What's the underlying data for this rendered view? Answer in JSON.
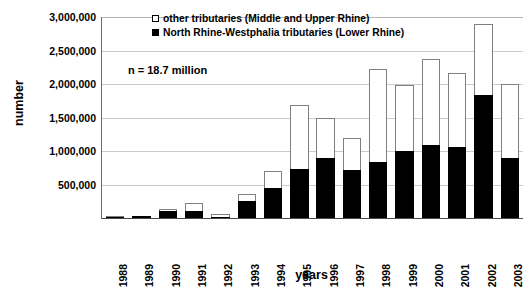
{
  "chart_data": {
    "type": "bar",
    "subtype": "stacked",
    "title": "",
    "xlabel": "years",
    "ylabel": "number",
    "ylim": [
      0,
      3000000
    ],
    "ytick_labels": [
      "3,000,000",
      "2,500,000",
      "2,000,000",
      "1,500,000",
      "1,000,000",
      "500,000"
    ],
    "ytick_values": [
      3000000,
      2500000,
      2000000,
      1500000,
      1000000,
      500000
    ],
    "grid": true,
    "legend_position": "top-center",
    "annotation": "n = 18.7 million",
    "categories": [
      "1988",
      "1989",
      "1990",
      "1991",
      "1992",
      "1993",
      "1994",
      "1995",
      "1996",
      "1997",
      "1998",
      "1999",
      "2000",
      "2001",
      "2002",
      "2003"
    ],
    "series": [
      {
        "name": "North Rhine-Westphalia tributaries (Lower Rhine)",
        "color": "#000000",
        "values": [
          4000,
          30000,
          110000,
          105000,
          10000,
          250000,
          450000,
          730000,
          900000,
          710000,
          840000,
          1000000,
          1090000,
          1060000,
          1830000,
          890000
        ]
      },
      {
        "name": "other tributaries (Middle and Upper Rhine)",
        "color": "#ffffff",
        "values": [
          1000,
          5000,
          25000,
          125000,
          50000,
          110000,
          250000,
          960000,
          590000,
          480000,
          1390000,
          990000,
          1290000,
          1100000,
          1070000,
          1110000
        ]
      }
    ],
    "totals": [
      5000,
      35000,
      135000,
      230000,
      60000,
      360000,
      700000,
      1690000,
      1490000,
      1190000,
      2230000,
      1990000,
      2380000,
      2160000,
      2900000,
      2000000
    ]
  },
  "legend": {
    "entries": [
      {
        "label": "other tributaries (Middle and Upper Rhine)",
        "swatch": "open-square-swatch"
      },
      {
        "label": "North Rhine-Westphalia tributaries (Lower Rhine)",
        "swatch": "filled-square-swatch"
      }
    ]
  },
  "colors": {
    "nrw_fill": "#000000",
    "other_fill": "#ffffff",
    "bar_outline": "#808080",
    "gridline": "#c9c9c9",
    "axis": "#4a4a4a",
    "background": "#ffffff"
  }
}
